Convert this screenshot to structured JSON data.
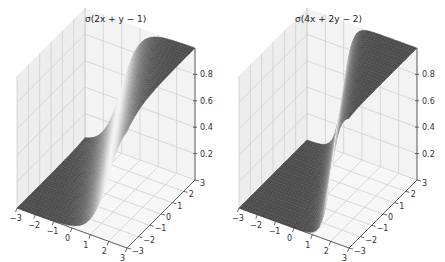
{
  "figure": {
    "background": "#ffffff",
    "pane_color": "#f2f2f2",
    "grid_color": "#cfcfcf",
    "surface_low_color": "#4a4a4a",
    "surface_high_color": "#4a4a4a",
    "surface_mid_color": "#e6e6e6"
  },
  "chart_data": [
    {
      "type": "surface",
      "title": "σ(2x + y − 1)",
      "function": "sigmoid(2x + y - 1)",
      "weights": {
        "wx": 2,
        "wy": 1,
        "b": -1
      },
      "xlabel": "",
      "ylabel": "",
      "zlabel": "",
      "xlim": [
        -3,
        3
      ],
      "ylim": [
        -3,
        3
      ],
      "zlim": [
        0,
        1
      ],
      "x_ticks": [
        "−3",
        "−2",
        "−1",
        "0",
        "1",
        "2",
        "3"
      ],
      "y_ticks": [
        "−3",
        "−2",
        "−1",
        "0",
        "1",
        "2",
        "3"
      ],
      "z_ticks": [
        "0.2",
        "0.4",
        "0.6",
        "0.8"
      ],
      "grid": true
    },
    {
      "type": "surface",
      "title": "σ(4x + 2y − 2)",
      "function": "sigmoid(4x + 2y - 2)",
      "weights": {
        "wx": 4,
        "wy": 2,
        "b": -2
      },
      "xlabel": "",
      "ylabel": "",
      "zlabel": "",
      "xlim": [
        -3,
        3
      ],
      "ylim": [
        -3,
        3
      ],
      "zlim": [
        0,
        1
      ],
      "x_ticks": [
        "−3",
        "−2",
        "−1",
        "0",
        "1",
        "2",
        "3"
      ],
      "y_ticks": [
        "−3",
        "−2",
        "−1",
        "0",
        "1",
        "2",
        "3"
      ],
      "z_ticks": [
        "0.2",
        "0.4",
        "0.6",
        "0.8"
      ],
      "grid": true
    }
  ]
}
